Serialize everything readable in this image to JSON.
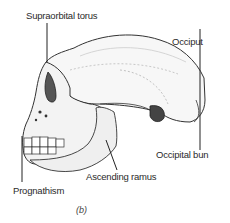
{
  "diagram": {
    "labels": [
      {
        "id": "supraorbital",
        "text": "Supraorbital torus"
      },
      {
        "id": "occiput",
        "text": "Occiput"
      },
      {
        "id": "occipital_bun",
        "text": "Occipital bun"
      },
      {
        "id": "ascending_ramus",
        "text": "Ascending ramus"
      },
      {
        "id": "prognathism",
        "text": "Prognathism"
      }
    ],
    "caption": "(b)"
  }
}
